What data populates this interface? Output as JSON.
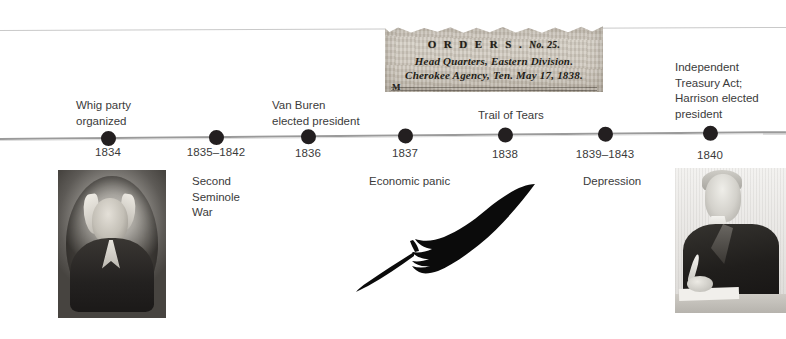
{
  "timeline": {
    "axis_color": "#9a9a9a",
    "dot_color": "#231f20",
    "text_color": "#3b3b3b",
    "events": [
      {
        "id": "whig-party",
        "year": "1834",
        "x": 108,
        "caption": "Whig party\norganized",
        "position": "above"
      },
      {
        "id": "second-seminole-war",
        "year": "1835–1842",
        "x": 216,
        "caption": "Second\nSeminole\nWar",
        "position": "below"
      },
      {
        "id": "van-buren-elected",
        "year": "1836",
        "x": 308,
        "caption": "Van Buren\nelected president",
        "position": "above"
      },
      {
        "id": "economic-panic",
        "year": "1837",
        "x": 405,
        "caption": "Economic panic",
        "position": "below"
      },
      {
        "id": "trail-of-tears",
        "year": "1838",
        "x": 505,
        "caption": "Trail of Tears",
        "position": "above"
      },
      {
        "id": "depression",
        "year": "1839–1843",
        "x": 605,
        "caption": "Depression",
        "position": "below"
      },
      {
        "id": "independent-treasury-act",
        "year": "1840",
        "x": 710,
        "caption": "Independent\nTreasury Act;\nHarrison elected\npresident",
        "position": "above"
      }
    ]
  },
  "images": {
    "clipping": {
      "name": "cherokee-removal-orders-clipping",
      "heading": "O R D E R S .",
      "heading_no": "No. 25.",
      "line2": "Head Quarters, Eastern Division.",
      "line3": "Cherokee Agency, Ten. May 17, 1838.",
      "drop_cap": "M"
    },
    "portrait_left": {
      "name": "daguerreotype-portrait-oval",
      "alt": "Oval daguerreotype portrait of a 19th-century man in a dark coat"
    },
    "quill": {
      "name": "quill-feather",
      "alt": "Black quill feather pen",
      "color": "#0b0b0b"
    },
    "portrait_right": {
      "name": "engraving-harrison-writing",
      "alt": "Engraving of William Henry Harrison seated writing with a quill"
    }
  }
}
